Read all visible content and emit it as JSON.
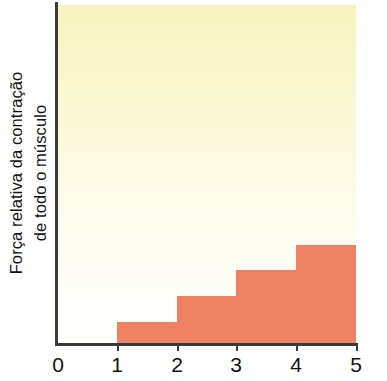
{
  "chart_data": {
    "type": "bar",
    "title": "",
    "subtitle": "",
    "xlabel": "",
    "ylabel": "Força relativa da contração de todo o músculo",
    "ylabel_lines": [
      "Força relativa da contração",
      "de todo o músculo"
    ],
    "x_tick_labels": [
      "0",
      "1",
      "2",
      "3",
      "4",
      "5"
    ],
    "x_ticks": [
      0,
      1,
      2,
      3,
      4,
      5
    ],
    "xlim": [
      0,
      5
    ],
    "ylim": [
      0,
      1
    ],
    "y_tick_labels": [],
    "grid": false,
    "legend": null,
    "categories": [
      "0-1",
      "1-2",
      "2-3",
      "3-4",
      "4-5"
    ],
    "values": [
      0,
      0.068,
      0.144,
      0.221,
      0.294
    ],
    "series": [
      {
        "name": "Força relativa da contração de todo o músculo",
        "values": [
          0,
          0.068,
          0.144,
          0.221,
          0.294
        ],
        "color": "#ef8262"
      }
    ],
    "steps": [
      {
        "x0": 0,
        "x1": 1,
        "value": 0
      },
      {
        "x0": 1,
        "x1": 2,
        "value": 0.068
      },
      {
        "x0": 2,
        "x1": 3,
        "value": 0.144
      },
      {
        "x0": 3,
        "x1": 4,
        "value": 0.221
      },
      {
        "x0": 4,
        "x1": 5,
        "value": 0.294
      }
    ],
    "colors": {
      "bar": "#ef8262",
      "background_top": "#f7f3bd",
      "background_bottom": "#ffffff",
      "axis": "#3a3a38",
      "text": "#121212"
    }
  },
  "axis": {
    "ticks": [
      {
        "label": "0",
        "x_px": 58
      },
      {
        "label": "1",
        "x_px": 117
      },
      {
        "label": "2",
        "x_px": 177
      },
      {
        "label": "3",
        "x_px": 236
      },
      {
        "label": "4",
        "x_px": 296
      },
      {
        "label": "5",
        "x_px": 356
      }
    ]
  },
  "bars": [
    {
      "name": "step-1-2",
      "left_px": 59,
      "top_px": 317,
      "width_px": 60,
      "height_px": 26
    },
    {
      "name": "step-2-3",
      "left_px": 119,
      "top_px": 291,
      "width_px": 59,
      "height_px": 52
    },
    {
      "name": "step-3-4",
      "left_px": 178,
      "top_px": 265,
      "width_px": 60,
      "height_px": 78
    },
    {
      "name": "step-4-5",
      "left_px": 238,
      "top_px": 240,
      "width_px": 60,
      "height_px": 103
    }
  ]
}
